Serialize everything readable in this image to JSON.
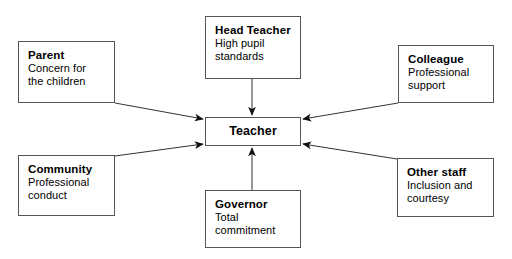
{
  "diagram": {
    "type": "hub-and-spoke",
    "center": {
      "id": "teacher",
      "title": "Teacher",
      "desc": ""
    },
    "nodes": [
      {
        "id": "parent",
        "title": "Parent",
        "desc": "Concern for\nthe children"
      },
      {
        "id": "head-teacher",
        "title": "Head Teacher",
        "desc": "High pupil\nstandards"
      },
      {
        "id": "colleague",
        "title": "Colleague",
        "desc": "Professional\nsupport"
      },
      {
        "id": "community",
        "title": "Community",
        "desc": "Professional\nconduct"
      },
      {
        "id": "governor",
        "title": "Governor",
        "desc": "Total\ncommitment"
      },
      {
        "id": "other-staff",
        "title": "Other staff",
        "desc": "Inclusion and\ncourtesy"
      }
    ],
    "connectors": [
      {
        "id": "parent-to-teacher",
        "from": "parent",
        "to": "teacher",
        "direction": "to-center"
      },
      {
        "id": "head-teacher-to-teacher",
        "from": "head-teacher",
        "to": "teacher",
        "direction": "to-center"
      },
      {
        "id": "colleague-to-teacher",
        "from": "colleague",
        "to": "teacher",
        "direction": "to-center"
      },
      {
        "id": "community-to-teacher",
        "from": "community",
        "to": "teacher",
        "direction": "to-center"
      },
      {
        "id": "governor-to-teacher",
        "from": "governor",
        "to": "teacher",
        "direction": "to-center"
      },
      {
        "id": "other-staff-to-teacher",
        "from": "other-staff",
        "to": "teacher",
        "direction": "to-center"
      }
    ],
    "colors": {
      "background": "#ffffff",
      "box_border": "#555555",
      "connector": "#333333",
      "text": "#000000"
    }
  }
}
